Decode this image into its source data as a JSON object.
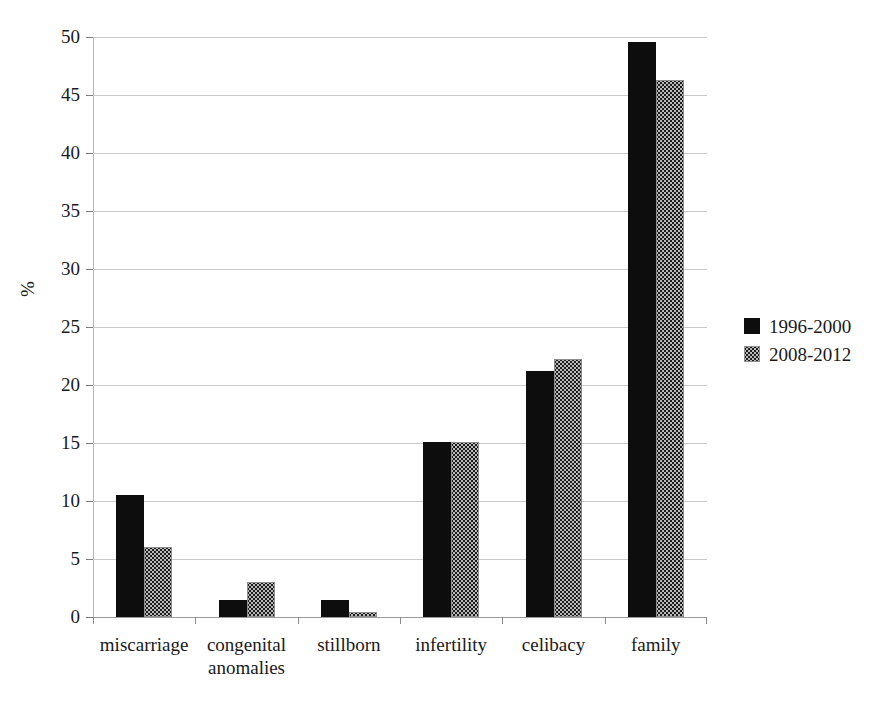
{
  "chart_data": {
    "type": "bar",
    "title": "",
    "subtitle": "",
    "xlabel": "",
    "ylabel": "%",
    "ylim": [
      0,
      50
    ],
    "ytick_step": 5,
    "yticks": [
      50,
      45,
      40,
      35,
      30,
      25,
      20,
      15,
      10,
      5,
      0
    ],
    "grid": true,
    "legend_position": "right",
    "categories": [
      "miscarriage",
      "congenital anomalies",
      "stillborn",
      "infertility",
      "celibacy",
      "family"
    ],
    "category_lines": [
      [
        "miscarriage"
      ],
      [
        "congenital",
        "anomalies"
      ],
      [
        "stillborn"
      ],
      [
        "infertility"
      ],
      [
        "celibacy"
      ],
      [
        "family"
      ]
    ],
    "series": [
      {
        "name": "1996-2000",
        "color": "#0d0d0d",
        "pattern": "solid",
        "values": [
          10.5,
          1.5,
          1.5,
          15.1,
          21.2,
          49.6
        ]
      },
      {
        "name": "2008-2012",
        "color": "#b9b9b9",
        "pattern": "checkerboard",
        "values": [
          6.0,
          3.0,
          0.4,
          15.1,
          22.2,
          46.3
        ]
      }
    ]
  },
  "legend": {
    "entries": [
      {
        "label": "1996-2000"
      },
      {
        "label": "2008-2012"
      }
    ]
  },
  "axis": {
    "y_title": "%"
  }
}
